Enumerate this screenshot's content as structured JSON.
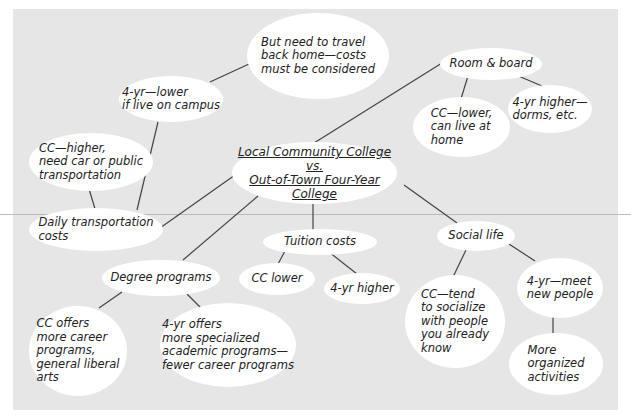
{
  "diagram": {
    "type": "concept-map",
    "background_color": "#e6e6e6",
    "node_color": "#ffffff",
    "edge_color": "#444444",
    "center": {
      "id": "center",
      "label": "Local Community College\nvs.\nOut-of-Town Four-Year College"
    },
    "nodes": [
      {
        "id": "travel_home",
        "label": "But need to travel\nback home—costs\nmust be considered"
      },
      {
        "id": "fouryr_lower",
        "label": "4-yr—lower\nif live on campus"
      },
      {
        "id": "cc_higher",
        "label": "CC—higher,\nneed car or public\ntransportation"
      },
      {
        "id": "daily_transport",
        "label": "Daily transportation\ncosts"
      },
      {
        "id": "room_board",
        "label": "Room & board"
      },
      {
        "id": "cc_lower_home",
        "label": "CC—lower,\ncan live at\nhome"
      },
      {
        "id": "fouryr_dorms",
        "label": "4-yr higher—\ndorms, etc."
      },
      {
        "id": "tuition",
        "label": "Tuition costs"
      },
      {
        "id": "cc_lower",
        "label": "CC lower"
      },
      {
        "id": "fouryr_higher",
        "label": "4-yr higher"
      },
      {
        "id": "degree",
        "label": "Degree programs"
      },
      {
        "id": "cc_offers",
        "label": "CC offers\nmore career\nprograms,\ngeneral liberal\narts"
      },
      {
        "id": "fouryr_offers",
        "label": "4-yr offers\nmore specialized\nacademic programs—\nfewer career programs"
      },
      {
        "id": "social",
        "label": "Social life"
      },
      {
        "id": "cc_socialize",
        "label": "CC—tend\nto socialize\nwith people\nyou already\nknow"
      },
      {
        "id": "fouryr_meet",
        "label": "4-yr—meet\nnew people"
      },
      {
        "id": "organized",
        "label": "More\norganized\nactivities"
      }
    ],
    "edges": [
      [
        "center",
        "daily_transport"
      ],
      [
        "center",
        "room_board"
      ],
      [
        "center",
        "tuition"
      ],
      [
        "center",
        "degree"
      ],
      [
        "center",
        "social"
      ],
      [
        "daily_transport",
        "cc_higher"
      ],
      [
        "daily_transport",
        "fouryr_lower"
      ],
      [
        "fouryr_lower",
        "travel_home"
      ],
      [
        "room_board",
        "cc_lower_home"
      ],
      [
        "room_board",
        "fouryr_dorms"
      ],
      [
        "tuition",
        "cc_lower"
      ],
      [
        "tuition",
        "fouryr_higher"
      ],
      [
        "degree",
        "cc_offers"
      ],
      [
        "degree",
        "fouryr_offers"
      ],
      [
        "social",
        "cc_socialize"
      ],
      [
        "social",
        "fouryr_meet"
      ],
      [
        "fouryr_meet",
        "organized"
      ]
    ]
  }
}
